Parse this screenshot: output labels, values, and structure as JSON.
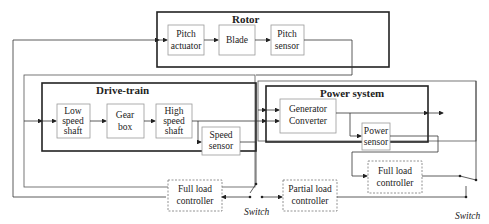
{
  "groups": {
    "rotor": "Rotor",
    "drivetrain": "Drive-train",
    "power": "Power system"
  },
  "blocks": {
    "pitch_actuator": [
      "Pitch",
      "actuator"
    ],
    "blade": [
      "Blade"
    ],
    "pitch_sensor": [
      "Pitch",
      "sensor"
    ],
    "low_speed_shaft": [
      "Low",
      "speed",
      "shaft"
    ],
    "gear_box": [
      "Gear",
      "box"
    ],
    "high_speed_shaft": [
      "High",
      "speed",
      "shaft"
    ],
    "speed_sensor": [
      "Speed",
      "sensor"
    ],
    "generator_converter": [
      "Generator",
      "Converter"
    ],
    "power_sensor": [
      "Power",
      "sensor"
    ],
    "full_load_controller_left": [
      "Full load",
      "controller"
    ],
    "partial_load_controller": [
      "Partial load",
      "controller"
    ],
    "full_load_controller_right": [
      "Full load",
      "controller"
    ]
  },
  "switches": {
    "left": "Switch",
    "right": "Switch"
  }
}
